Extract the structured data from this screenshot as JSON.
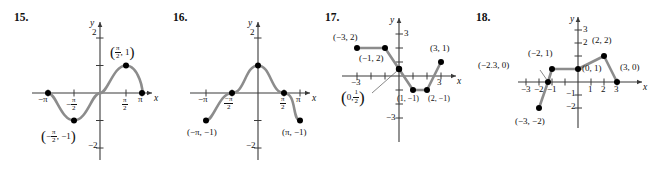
{
  "page": {
    "width": 668,
    "height": 176,
    "background": "#ffffff",
    "curve_color": "#8c8c8c",
    "axis_color": "#3a3a3a",
    "point_color": "#000000",
    "text_color": "#111111"
  },
  "problems": [
    {
      "number": "15.",
      "graph_type": "sine-curve",
      "axis_labels": {
        "x": "x",
        "y": "y"
      },
      "y_ticks": [
        "2",
        "-2"
      ],
      "x_tick_labels": [
        "-π",
        "π"
      ],
      "x_tick_fraction_labels": [
        {
          "sign": "−",
          "num": "π",
          "den": "2"
        },
        {
          "sign": "",
          "num": "π",
          "den": "2"
        }
      ],
      "annotations": [
        {
          "text_open": "(",
          "num": "π",
          "den": "2",
          "text_close": ", 1)"
        },
        {
          "text_open": "(−",
          "num": "π",
          "den": "2",
          "text_close": ", −1)"
        }
      ],
      "points": [
        {
          "x": -3.14159,
          "y": 0
        },
        {
          "x": -1.5708,
          "y": -1
        },
        {
          "x": 1.5708,
          "y": 1
        },
        {
          "x": 3.14159,
          "y": 0
        }
      ],
      "description": "y = sin x from -pi to pi"
    },
    {
      "number": "16.",
      "graph_type": "cosine-curve",
      "axis_labels": {
        "x": "x",
        "y": "y"
      },
      "y_ticks": [
        "2",
        "-2"
      ],
      "x_tick_labels": [
        "-π",
        "π"
      ],
      "x_tick_fraction_labels": [
        {
          "sign": "−",
          "num": "π",
          "den": "2"
        },
        {
          "sign": "",
          "num": "π",
          "den": "2"
        }
      ],
      "annotations": [
        {
          "text": "(−π, −1)"
        },
        {
          "text": "(π, −1)"
        }
      ],
      "points": [
        {
          "x": -3.14159,
          "y": -1
        },
        {
          "x": -1.5708,
          "y": 0
        },
        {
          "x": 0,
          "y": 1
        },
        {
          "x": 1.5708,
          "y": 0
        },
        {
          "x": 3.14159,
          "y": -1
        }
      ],
      "description": "y = cos x from -pi to pi"
    },
    {
      "number": "17.",
      "graph_type": "piecewise-linear",
      "axis_labels": {
        "x": "x",
        "y": "y"
      },
      "y_ticks": [
        "3",
        "-3"
      ],
      "x_ticks": [
        "-3",
        "3"
      ],
      "annotations": [
        {
          "text": "(−3, 2)"
        },
        {
          "text": "(−1, 2)"
        },
        {
          "text_open": "(",
          "pre": "0,",
          "num": "1",
          "den": "2",
          "text_close": ")"
        },
        {
          "text": "(1, −1)"
        },
        {
          "text": "(2, −1)"
        },
        {
          "text": "(3, 1)"
        }
      ],
      "points": [
        {
          "x": -3,
          "y": 2
        },
        {
          "x": -1,
          "y": 2
        },
        {
          "x": 0,
          "y": 0.5
        },
        {
          "x": 1,
          "y": -1
        },
        {
          "x": 2,
          "y": -1
        },
        {
          "x": 3,
          "y": 1
        }
      ],
      "description": "piecewise linear through (-3,2),(-1,2),(0,1/2),(1,-1),(2,-1),(3,1)"
    },
    {
      "number": "18.",
      "graph_type": "piecewise-linear",
      "axis_labels": {
        "x": "x",
        "y": "y"
      },
      "y_ticks": [
        "3",
        "2",
        "-1",
        "-2"
      ],
      "x_ticks": [
        "-3",
        "-2",
        "-1",
        "1",
        "2",
        "3"
      ],
      "annotations": [
        {
          "text": "(−2.3, 0)"
        },
        {
          "text": "(−2, 1)"
        },
        {
          "text": "(0, 1)"
        },
        {
          "text": "(2, 2)"
        },
        {
          "text": "(3, 0)"
        },
        {
          "text": "(−3, −2)"
        }
      ],
      "points": [
        {
          "x": -3,
          "y": -2
        },
        {
          "x": -2.3,
          "y": 0
        },
        {
          "x": -2,
          "y": 1
        },
        {
          "x": 0,
          "y": 1
        },
        {
          "x": 2,
          "y": 2
        },
        {
          "x": 3,
          "y": 0
        }
      ],
      "description": "piecewise linear through (-3,-2),(-2.3,0),(-2,1),(0,1),(2,2),(3,0)"
    }
  ]
}
